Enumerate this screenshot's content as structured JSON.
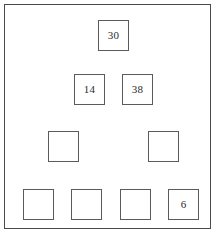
{
  "diagram": {
    "type": "pyramid-grid",
    "frame": {
      "color": "#4a4a4a"
    },
    "cell_border_color": "#5b5b5b",
    "background": "#ffffff",
    "rows": [
      {
        "index": 0,
        "cells": [
          {
            "value": "30",
            "filled": true,
            "x": 97,
            "y": 19,
            "w": 31,
            "h": 31
          }
        ]
      },
      {
        "index": 1,
        "cells": [
          {
            "value": "14",
            "filled": true,
            "x": 73,
            "y": 73,
            "w": 31,
            "h": 31
          },
          {
            "value": "38",
            "filled": true,
            "x": 121,
            "y": 73,
            "w": 31,
            "h": 31
          }
        ]
      },
      {
        "index": 2,
        "cells": [
          {
            "value": "",
            "filled": false,
            "x": 47,
            "y": 130,
            "w": 31,
            "h": 31
          },
          {
            "value": "",
            "filled": false,
            "x": 147,
            "y": 130,
            "w": 31,
            "h": 31
          }
        ]
      },
      {
        "index": 3,
        "cells": [
          {
            "value": "",
            "filled": false,
            "x": 22,
            "y": 188,
            "w": 31,
            "h": 31
          },
          {
            "value": "",
            "filled": false,
            "x": 70,
            "y": 188,
            "w": 31,
            "h": 31
          },
          {
            "value": "",
            "filled": false,
            "x": 119,
            "y": 188,
            "w": 31,
            "h": 31
          },
          {
            "value": "6",
            "filled": true,
            "x": 167,
            "y": 188,
            "w": 31,
            "h": 31
          }
        ]
      }
    ]
  }
}
